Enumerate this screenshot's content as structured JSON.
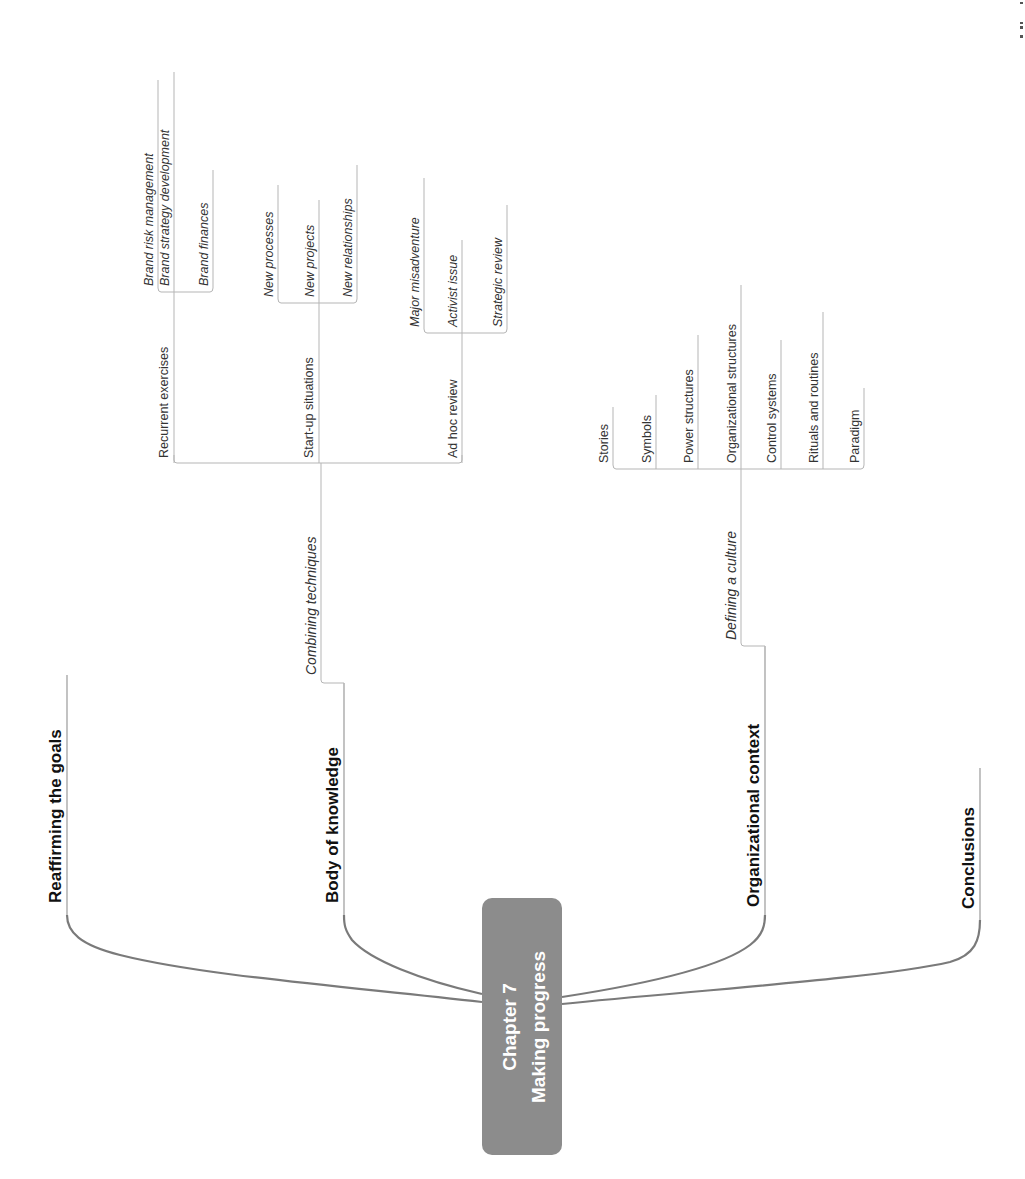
{
  "central_topic": {
    "line1": "Chapter  7",
    "line2": "Making progress",
    "color": "#8c8c8c"
  },
  "main_topics": [
    {
      "label": "Reaffirming the goals"
    },
    {
      "label": "Body of knowledge"
    },
    {
      "label": "Organizational context"
    },
    {
      "label": "Conclusions"
    }
  ],
  "body_of_knowledge": {
    "subtopic": "Combining techniques",
    "groups": [
      {
        "label": "Recurrent exercises",
        "children": [
          "Brand risk management",
          "Brand strategy development",
          "Brand finances"
        ]
      },
      {
        "label": "Start-up situations",
        "children": [
          "New processes",
          "New projects",
          "New relationships"
        ]
      },
      {
        "label": "Ad hoc review",
        "children": [
          "Major misadventure",
          "Activist issue",
          "Strategic review"
        ]
      }
    ]
  },
  "organizational_context": {
    "subtopic": "Defining a culture",
    "children": [
      "Stories",
      "Symbols",
      "Power structures",
      "Organizational structures",
      "Control systems",
      "Rituals and routines",
      "Paradigm"
    ]
  }
}
